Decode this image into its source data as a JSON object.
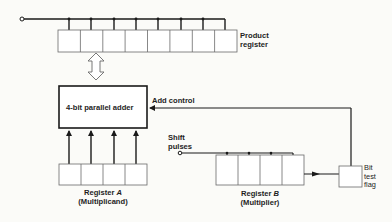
{
  "diagram": {
    "type": "block-diagram",
    "product_register": {
      "label_line1": "Product",
      "label_line2": "register",
      "cells": 8
    },
    "adder": {
      "label": "4-bit parallel  adder"
    },
    "add_control": {
      "label": "Add control"
    },
    "shift_pulses": {
      "label_line1": "Shift",
      "label_line2": "pulses"
    },
    "register_a": {
      "label_prefix": "Register ",
      "label_var": "A",
      "sublabel": "(Multiplicand)",
      "cells": 4
    },
    "register_b": {
      "label_prefix": "Register ",
      "label_var": "B",
      "sublabel": "(Multiplier)",
      "cells": 4
    },
    "bit_test_flag": {
      "label_line1": "Bit",
      "label_line2": "test",
      "label_line3": "flag"
    }
  }
}
